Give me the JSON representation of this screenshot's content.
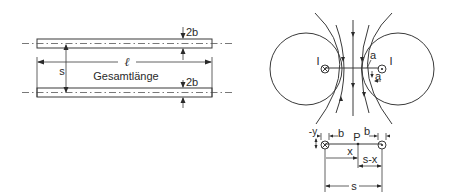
{
  "left_diagram": {
    "title": "Two parallel conductors",
    "labels": {
      "length": "ℓ",
      "total_length": "Gesamtlänge",
      "spacing": "s",
      "thickness_top": "2b",
      "thickness_bottom": "2b"
    }
  },
  "right_diagram": {
    "title": "Magnetic field between antiparallel currents",
    "labels": {
      "current_left": "I",
      "current_right": "I",
      "radius_label": "a",
      "direction_label": "a",
      "symbol_into_page": "⊗",
      "symbol_out_of_page": "⊙"
    }
  },
  "detail_diagram": {
    "labels": {
      "neg_y": "-y",
      "b_left": "b",
      "b_right": "b",
      "point": "P",
      "x": "x",
      "s_minus_x": "s-x",
      "s": "s"
    }
  },
  "colors": {
    "line": "#3a3a3a",
    "text": "#2a2a2a",
    "background": "#ffffff"
  }
}
